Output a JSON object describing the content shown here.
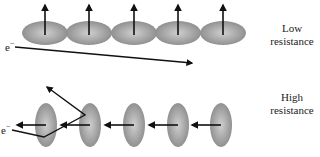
{
  "diagram": {
    "top_panel": {
      "label_line1": "Low",
      "label_line2": "resistance",
      "electron_label": "e",
      "electron_charge": "−",
      "moments_direction": "up (parallel, aligned)",
      "atom_count": 5
    },
    "bottom_panel": {
      "label_line1": "High",
      "label_line2": "resistance",
      "electron_label": "e",
      "electron_charge": "−",
      "moments_direction": "left (in-plane)",
      "atom_count": 5
    },
    "colors": {
      "atom_fill_center": "#c8c8c8",
      "atom_fill_edge": "#8a8a8a",
      "arrow": "#111111"
    }
  }
}
